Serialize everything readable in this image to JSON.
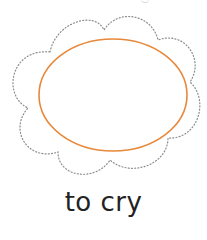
{
  "card": {
    "label": "to cry",
    "shape": "cloud-outline",
    "inner_shape": "oval",
    "colors": {
      "oval_stroke": "#e8883a",
      "cloud_stroke": "#8a8a8a",
      "text": "#222222",
      "background": "#ffffff"
    }
  }
}
